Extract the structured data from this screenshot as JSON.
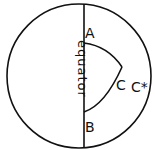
{
  "diagram": {
    "type": "spherical-geometry-sketch",
    "circle": {
      "cx": 79,
      "cy": 76,
      "r": 72
    },
    "equator_line_x": 84,
    "labels": {
      "equator": "equator",
      "point_a": "A",
      "point_b": "B",
      "point_c": "C",
      "point_c_star": "C*"
    },
    "stroke_color": "#111111",
    "background": "#ffffff"
  }
}
